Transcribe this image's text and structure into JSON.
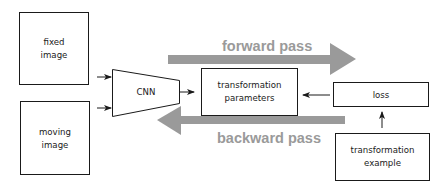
{
  "diagram": {
    "nodes": {
      "fixed_image": {
        "lines": [
          "fixed",
          "image"
        ]
      },
      "moving_image": {
        "lines": [
          "moving",
          "image"
        ]
      },
      "cnn": {
        "label": "CNN"
      },
      "transformation_parameters": {
        "lines": [
          "transformation",
          "parameters"
        ]
      },
      "loss": {
        "label": "loss"
      },
      "transformation_example": {
        "lines": [
          "transformation",
          "example"
        ]
      }
    },
    "passes": {
      "forward": {
        "label": "forward pass",
        "direction": "right"
      },
      "backward": {
        "label": "backward pass",
        "direction": "left"
      }
    },
    "edges": [
      {
        "from": "fixed_image",
        "to": "cnn"
      },
      {
        "from": "moving_image",
        "to": "cnn"
      },
      {
        "from": "cnn",
        "to": "transformation_parameters"
      },
      {
        "from": "loss",
        "to": "transformation_parameters"
      },
      {
        "from": "transformation_example",
        "to": "loss"
      }
    ],
    "colors": {
      "stroke": "#1a1a1a",
      "pass_arrow": "#9a9a9a",
      "pass_text": "#9a9a9a",
      "background": "#ffffff"
    }
  }
}
